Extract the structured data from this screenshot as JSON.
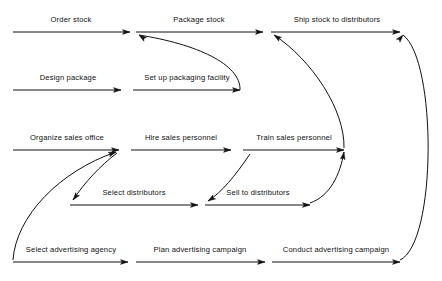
{
  "diagram": {
    "type": "activity-on-arrow network",
    "canvas": {
      "width": 442,
      "height": 281,
      "background": "#ffffff"
    },
    "style": {
      "line_color": "#111111",
      "line_width": 1,
      "text_color": "#111111",
      "font_size": 7.6
    },
    "activities": [
      {
        "id": "order-stock",
        "label": "Order stock",
        "row": 1,
        "x1": 13,
        "y1": 32,
        "x2": 130,
        "y2": 32,
        "label_x": 71,
        "label_y": 22
      },
      {
        "id": "package-stock",
        "label": "Package stock",
        "row": 1,
        "x1": 136,
        "y1": 32,
        "x2": 263,
        "y2": 32,
        "label_x": 199,
        "label_y": 22
      },
      {
        "id": "ship-stock-to-distributors",
        "label": "Ship stock to distributors",
        "row": 1,
        "x1": 271,
        "y1": 32,
        "x2": 400,
        "y2": 32,
        "label_x": 337,
        "label_y": 22
      },
      {
        "id": "design-package",
        "label": "Design package",
        "row": 2,
        "x1": 13,
        "y1": 90,
        "x2": 121,
        "y2": 90,
        "label_x": 68,
        "label_y": 80
      },
      {
        "id": "set-up-packaging-facility",
        "label": "Set up packaging facility",
        "row": 2,
        "x1": 133,
        "y1": 90,
        "x2": 240,
        "y2": 90,
        "label_x": 187,
        "label_y": 80
      },
      {
        "id": "organize-sales-office",
        "label": "Organize sales office",
        "row": 3,
        "x1": 13,
        "y1": 150,
        "x2": 119,
        "y2": 150,
        "label_x": 67,
        "label_y": 140
      },
      {
        "id": "hire-sales-personnel",
        "label": "Hire sales personnel",
        "row": 3,
        "x1": 131,
        "y1": 150,
        "x2": 231,
        "y2": 150,
        "label_x": 181,
        "label_y": 140
      },
      {
        "id": "train-sales-personnel",
        "label": "Train sales personnel",
        "row": 3,
        "x1": 243,
        "y1": 150,
        "x2": 344,
        "y2": 150,
        "label_x": 294,
        "label_y": 140
      },
      {
        "id": "select-distributors",
        "label": "Select distributors",
        "row": 4,
        "x1": 70,
        "y1": 205,
        "x2": 198,
        "y2": 205,
        "label_x": 134,
        "label_y": 195
      },
      {
        "id": "sell-to-distributors",
        "label": "Sell to distributors",
        "row": 4,
        "x1": 205,
        "y1": 205,
        "x2": 310,
        "y2": 205,
        "label_x": 258,
        "label_y": 195
      },
      {
        "id": "select-advertising-agency",
        "label": "Select advertising agency",
        "row": 5,
        "x1": 13,
        "y1": 262,
        "x2": 128,
        "y2": 262,
        "label_x": 71,
        "label_y": 252
      },
      {
        "id": "plan-advertising-campaign",
        "label": "Plan advertising campaign",
        "row": 5,
        "x1": 136,
        "y1": 262,
        "x2": 265,
        "y2": 262,
        "label_x": 200,
        "label_y": 252
      },
      {
        "id": "conduct-advertising-campaign",
        "label": "Conduct advertising campaign",
        "row": 5,
        "x1": 272,
        "y1": 262,
        "x2": 400,
        "y2": 262,
        "label_x": 336,
        "label_y": 252
      }
    ],
    "dependencies": [
      {
        "id": "packaging-facility-to-package-stock",
        "from": "set-up-packaging-facility",
        "to": "package-stock",
        "path": "M 240,90 C 241,64 196,44 139,35"
      },
      {
        "id": "train-personnel-to-ship-stock",
        "from": "train-sales-personnel",
        "to": "ship-stock-to-distributors",
        "path": "M 344,148 C 345,110 312,60 274,35"
      },
      {
        "id": "conduct-campaign-to-ship-stock",
        "from": "conduct-advertising-campaign",
        "to": "ship-stock-to-distributors",
        "path": "M 400,260 C 437,243 437,60 403,35"
      },
      {
        "id": "select-agency-to-organize-sales-office",
        "from": "select-advertising-agency",
        "to": "organize-sales-office",
        "path": "M 13,260 C 16,216 60,171 116,152"
      },
      {
        "id": "organize-sales-office-to-select-distributors",
        "from": "organize-sales-office",
        "to": "select-distributors",
        "path": "M 117,153 C 100,166 85,182 73,200"
      },
      {
        "id": "train-personnel-start-to-sell-to-distributors",
        "from": "train-sales-personnel",
        "to": "sell-to-distributors",
        "path": "M 250,154 C 235,176 222,192 208,201"
      },
      {
        "id": "sell-to-distributors-to-train-personnel",
        "from": "sell-to-distributors",
        "to": "train-sales-personnel",
        "path": "M 310,203 C 330,196 340,175 344,152"
      }
    ],
    "arrowheads": [
      {
        "id": "arrow-order-stock",
        "x": 130,
        "y": 32,
        "angle": 0
      },
      {
        "id": "arrow-package-stock",
        "x": 263,
        "y": 32,
        "angle": 0
      },
      {
        "id": "arrow-ship-stock",
        "x": 400,
        "y": 32,
        "angle": 0
      },
      {
        "id": "arrow-design-package",
        "x": 121,
        "y": 90,
        "angle": 0
      },
      {
        "id": "arrow-set-up-packaging",
        "x": 240,
        "y": 90,
        "angle": 0
      },
      {
        "id": "arrow-organize-sales-office",
        "x": 119,
        "y": 150,
        "angle": 0
      },
      {
        "id": "arrow-hire-sales-personnel",
        "x": 231,
        "y": 150,
        "angle": 0
      },
      {
        "id": "arrow-train-sales-personnel",
        "x": 344,
        "y": 150,
        "angle": 0
      },
      {
        "id": "arrow-select-distributors",
        "x": 198,
        "y": 205,
        "angle": 0
      },
      {
        "id": "arrow-sell-to-distributors",
        "x": 310,
        "y": 205,
        "angle": 0
      },
      {
        "id": "arrow-select-advertising-agency",
        "x": 128,
        "y": 262,
        "angle": 0
      },
      {
        "id": "arrow-plan-advertising-campaign",
        "x": 265,
        "y": 262,
        "angle": 0
      },
      {
        "id": "arrow-conduct-advertising-campaign",
        "x": 400,
        "y": 262,
        "angle": 0
      },
      {
        "id": "arrow-into-package-stock",
        "x": 139,
        "y": 35,
        "angle": 215
      },
      {
        "id": "arrow-into-ship-stock-from-train",
        "x": 274,
        "y": 35,
        "angle": 215
      },
      {
        "id": "arrow-into-ship-stock-from-campaign",
        "x": 403,
        "y": 35,
        "angle": 310
      },
      {
        "id": "arrow-into-organize-sales-office-from-agency",
        "x": 116,
        "y": 152,
        "angle": 340
      },
      {
        "id": "arrow-into-select-distributors",
        "x": 73,
        "y": 200,
        "angle": 128
      },
      {
        "id": "arrow-into-sell-to-distributors",
        "x": 208,
        "y": 201,
        "angle": 147
      },
      {
        "id": "arrow-into-train-personnel-from-sell",
        "x": 344,
        "y": 152,
        "angle": 280
      }
    ]
  }
}
